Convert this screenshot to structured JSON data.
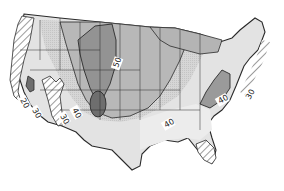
{
  "map": {
    "subject": "Contiguous United States contour map",
    "colors": {
      "background": "#ffffff",
      "lightest": "#e6e6e6",
      "light": "#cfcfcf",
      "medium": "#b4b4b4",
      "dark": "#939393",
      "darkest": "#6e6e6e",
      "lines": "#2a2a2a",
      "hatch": "#3a3a3a"
    },
    "contour_labels": [
      {
        "id": "label-20-west",
        "text": "20"
      },
      {
        "id": "label-30-west",
        "text": "30"
      },
      {
        "id": "label-30-sierra",
        "text": "30"
      },
      {
        "id": "label-40-west",
        "text": "40"
      },
      {
        "id": "label-50-plains",
        "text": "50"
      },
      {
        "id": "label-40-south",
        "text": "40"
      },
      {
        "id": "label-40-east",
        "text": "40"
      },
      {
        "id": "label-30-east",
        "text": "30"
      }
    ],
    "hatched_regions": [
      "pacific-coast",
      "sierra-nevada",
      "florida",
      "atlantic-coast"
    ]
  }
}
